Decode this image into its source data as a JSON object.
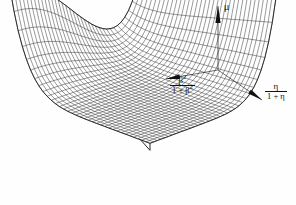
{
  "figure": {
    "type": "surface-mesh-3d",
    "background_color": "#fefefe",
    "line_color": "#111111",
    "width": 296,
    "height": 205
  },
  "axes": {
    "vertical": {
      "name": "mu-axis",
      "label": "μ",
      "origin": [
        218,
        70
      ],
      "tip": [
        218,
        6
      ],
      "arrow": "solid-tapered-up"
    },
    "left": {
      "name": "beta-axis",
      "label_numerator": "β",
      "label_numerator_sup": "2",
      "label_denominator_a": "1 + β",
      "label_denominator_sup": "2",
      "label_plain": "β²/(1+β²)",
      "origin": [
        218,
        70
      ],
      "tip": [
        166,
        79
      ],
      "arrow": "solid-tapered-down-left"
    },
    "right": {
      "name": "eta-axis",
      "label_numerator": "η",
      "label_denominator": "1 + η",
      "label_plain": "η/(1+η)",
      "origin": [
        218,
        70
      ],
      "tip": [
        262,
        100
      ],
      "arrow": "solid-tapered-down-right"
    }
  },
  "chart_data": {
    "type": "surface",
    "title": "",
    "xlabel": "β²/(1+β²)",
    "ylabel": "η/(1+η)",
    "zlabel": "μ",
    "grid": true,
    "legend": null,
    "mesh_rows": 34,
    "mesh_cols": 34,
    "x_range": [
      0,
      1
    ],
    "y_range": [
      0,
      1
    ],
    "z_range": [
      0,
      1
    ],
    "projection": {
      "origin_px": [
        150,
        150
      ],
      "x_axis_px": [
        -140,
        -52
      ],
      "y_axis_px": [
        126,
        -47
      ],
      "z_axis_px": [
        0,
        -112
      ]
    },
    "surface_model": {
      "formula": "z = 0.06 + 0.92*(u^8) * (0.55 + 0.45*cos(pi*v)) + 0.88*(v^9)*(1-0.55*u)",
      "u_is": "β²/(1+β²)",
      "v_is": "η/(1+η)"
    },
    "sample_corners": [
      {
        "u": 0,
        "v": 0,
        "z": 0.06
      },
      {
        "u": 1,
        "v": 0,
        "z": 0.98
      },
      {
        "u": 0,
        "v": 1,
        "z": 0.94
      },
      {
        "u": 1,
        "v": 1,
        "z": 0.95
      }
    ]
  },
  "baseline": {
    "name": "base-skirt",
    "visible": true,
    "offset_px": 7
  }
}
